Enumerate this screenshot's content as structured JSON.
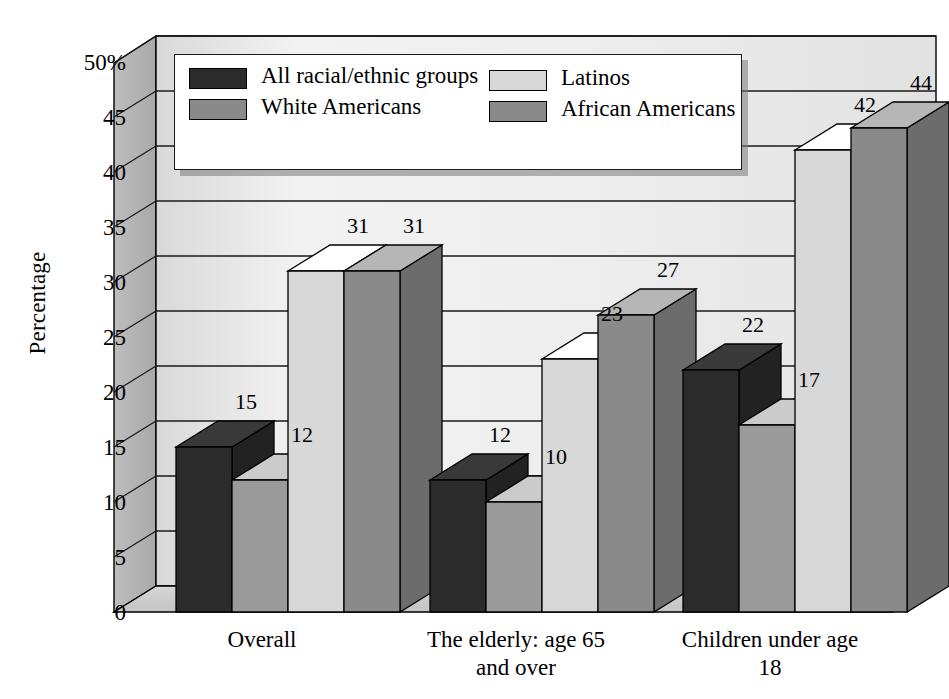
{
  "chart_data": {
    "type": "bar",
    "title": "",
    "xlabel": "",
    "ylabel": "Percentage",
    "ylim": [
      0,
      50
    ],
    "grid": true,
    "legend_position": "top-inside",
    "style": "3d-clustered-column",
    "categories": [
      "Overall",
      "The elderly: age 65\nand over",
      "Children under age 18"
    ],
    "series": [
      {
        "name": "All racial/ethnic groups",
        "color": "#2b2b2b",
        "values": [
          15,
          12,
          22
        ]
      },
      {
        "name": "White Americans",
        "color": "#9a9a9a",
        "values": [
          12,
          10,
          17
        ]
      },
      {
        "name": "Latinos",
        "color": "#d8d8d8",
        "values": [
          31,
          23,
          42
        ]
      },
      {
        "name": "African Americans",
        "color": "#8a8a8a",
        "values": [
          31,
          27,
          44
        ]
      }
    ],
    "y_ticks": [
      "0",
      "5",
      "10",
      "15",
      "20",
      "25",
      "30",
      "35",
      "40",
      "45",
      "50%"
    ],
    "y_tick_values": [
      0,
      5,
      10,
      15,
      20,
      25,
      30,
      35,
      40,
      45,
      50
    ]
  },
  "legend": {
    "entries": [
      {
        "label": "All racial/ethnic groups",
        "color": "#2b2b2b"
      },
      {
        "label": "White Americans",
        "color": "#8a8a8a"
      },
      {
        "label": "Latinos",
        "color": "#d8d8d8"
      },
      {
        "label": "African Americans",
        "color": "#8a8a8a"
      }
    ]
  },
  "palette": {
    "wall_back": "#e8e8e8",
    "wall_side": "#b8b8b8",
    "floor_top": "#d0d0d0",
    "gridline": "#1a1a1a",
    "outline": "#000000",
    "page_bg": "#ffffff"
  }
}
